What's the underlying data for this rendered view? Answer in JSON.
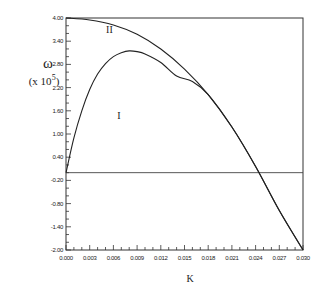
{
  "chart_data": {
    "type": "line",
    "title": "",
    "xlabel": "K",
    "ylabel": "ω",
    "ylabel_scale": "(x 10^5)",
    "ylabel_scale_base": "(x 10",
    "ylabel_scale_exp": "5",
    "ylabel_scale_close": ")",
    "xlim": [
      0.0,
      0.03
    ],
    "ylim": [
      -2.0,
      4.0
    ],
    "grid": false,
    "legend": "none (curves labeled inline)",
    "x_ticks": [
      "0.000",
      "0.003",
      "0.006",
      "0.009",
      "0.012",
      "0.015",
      "0.018",
      "0.021",
      "0.024",
      "0.027",
      "0.030"
    ],
    "y_ticks": [
      "4.00",
      "3.40",
      "2.80",
      "2.20",
      "1.60",
      "1.00",
      "0.40",
      "-0.20",
      "-0.80",
      "-1.40",
      "-2.00"
    ],
    "reference_lines": [
      {
        "type": "horizontal",
        "y": 0.0
      }
    ],
    "annotations": [
      {
        "text": "II",
        "x": 0.0055,
        "y": 3.6
      },
      {
        "text": "I",
        "x": 0.0067,
        "y": 1.4
      }
    ],
    "series": [
      {
        "name": "II",
        "x": [
          0.0,
          0.003,
          0.006,
          0.009,
          0.012,
          0.015,
          0.018,
          0.021,
          0.024,
          0.027,
          0.03
        ],
        "values": [
          4.0,
          3.95,
          3.82,
          3.58,
          3.2,
          2.68,
          2.02,
          1.18,
          0.16,
          -0.98,
          -2.0
        ]
      },
      {
        "name": "I",
        "x": [
          0.0,
          0.001,
          0.002,
          0.003,
          0.004,
          0.005,
          0.006,
          0.007,
          0.008,
          0.009,
          0.01,
          0.012,
          0.014,
          0.016,
          0.018,
          0.021,
          0.024,
          0.027,
          0.03
        ],
        "values": [
          0.0,
          0.9,
          1.6,
          2.15,
          2.55,
          2.82,
          3.0,
          3.1,
          3.15,
          3.13,
          3.07,
          2.85,
          2.5,
          2.36,
          2.02,
          1.18,
          0.16,
          -0.98,
          -2.0
        ]
      }
    ]
  }
}
